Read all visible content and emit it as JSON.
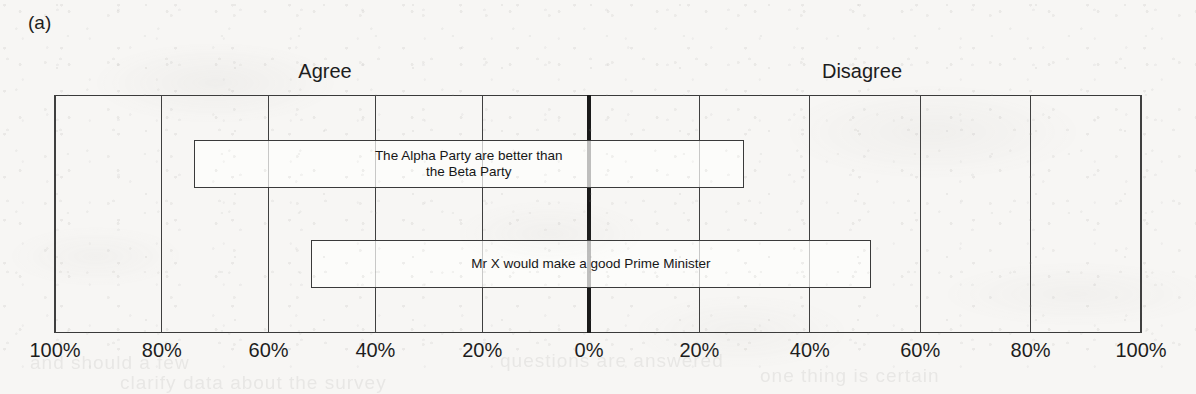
{
  "panel": {
    "label": "(a)"
  },
  "headers": {
    "left": "Agree",
    "right": "Disagree"
  },
  "axis": {
    "tick_labels": [
      "100%",
      "80%",
      "60%",
      "40%",
      "20%",
      "0%",
      "20%",
      "40%",
      "60%",
      "80%",
      "100%"
    ]
  },
  "bars": [
    {
      "label": "The Alpha Party are better than\nthe Beta Party"
    },
    {
      "label": "Mr X would make a good Prime Minister"
    }
  ],
  "colors": {
    "ink": "#3a3a3a",
    "center_line": "#1a1a1a",
    "paper": "#f7f6f4",
    "bar_fill": "#fdfdfc"
  },
  "chart_data": {
    "type": "bar",
    "subtype": "diverging-horizontal-bar",
    "title": "",
    "subtitle": "",
    "panel_label": "(a)",
    "xlabel": "",
    "ylabel": "",
    "orientation": "horizontal",
    "diverging": true,
    "center_value": 0,
    "left_direction_label": "Agree",
    "right_direction_label": "Disagree",
    "xlim": [
      -100,
      100
    ],
    "xticks": [
      -100,
      -80,
      -60,
      -40,
      -20,
      0,
      20,
      40,
      60,
      80,
      100
    ],
    "xtick_labels": [
      "100%",
      "80%",
      "60%",
      "40%",
      "20%",
      "0%",
      "20%",
      "40%",
      "60%",
      "80%",
      "100%"
    ],
    "xtick_units": "percent",
    "grid": true,
    "grid_axis": "x",
    "legend": false,
    "legend_position": "none",
    "categories": [
      "The Alpha Party are better than the Beta Party",
      "Mr X would make a good Prime Minister"
    ],
    "series": [
      {
        "name": "Agree",
        "values": [
          74,
          52
        ]
      },
      {
        "name": "Disagree",
        "values": [
          28,
          51
        ]
      }
    ],
    "bars": [
      {
        "category": "The Alpha Party are better than the Beta Party",
        "agree_percent": 74,
        "disagree_percent": 28,
        "span_start_percent": -74,
        "span_end_percent": 28
      },
      {
        "category": "Mr X would make a good Prime Minister",
        "agree_percent": 52,
        "disagree_percent": 51,
        "span_start_percent": -52,
        "span_end_percent": 51
      }
    ],
    "annotations": []
  },
  "bleed_through": [
    {
      "text": "and should a few",
      "left": "30px",
      "top": "352px"
    },
    {
      "text": "questions are answered",
      "left": "500px",
      "top": "350px"
    },
    {
      "text": "clarify data about the survey",
      "left": "120px",
      "top": "372px"
    },
    {
      "text": "one thing is certain",
      "left": "760px",
      "top": "365px"
    }
  ]
}
